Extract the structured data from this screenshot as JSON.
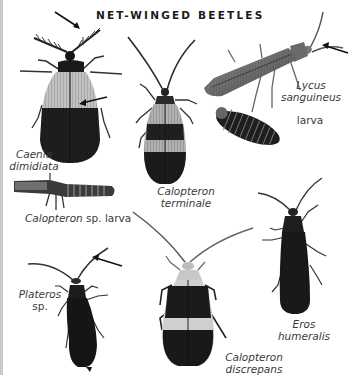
{
  "page": {
    "title": "NET-WINGED BEETLES",
    "background": "#ffffff",
    "edge_strip_color": "#c9c9c9"
  },
  "specimens": [
    {
      "id": "caenia-dimidiata",
      "label_line1": "Caenia",
      "label_line2": "dimidiata",
      "italic": true,
      "annotation": "arrow pointing to pectinate antenna and wing reticulation"
    },
    {
      "id": "calopteron-terminale",
      "label_line1": "Calopteron",
      "label_line2": "terminale",
      "italic": true
    },
    {
      "id": "lycus-sanguineus",
      "label_line1": "Lycus",
      "label_line2": "sanguineus",
      "italic": true,
      "annotation": "arrow pointing to antenna"
    },
    {
      "id": "lycus-larva",
      "label_line1": "larva",
      "italic": false
    },
    {
      "id": "calopteron-larva",
      "label_genus": "Calopteron",
      "label_rest": " sp. larva"
    },
    {
      "id": "plateros-sp",
      "label_line1": "Plateros",
      "label_line2": "sp.",
      "annotation": "arrow pointing to antenna"
    },
    {
      "id": "calopteron-discrepans",
      "label_line1": "Calopteron",
      "label_line2": "discrepans",
      "italic": true
    },
    {
      "id": "eros-humeralis",
      "label_line1": "Eros",
      "label_line2": "humeralis",
      "italic": true
    }
  ],
  "colors": {
    "dark_band": "#1c1c1c",
    "light_wing": "#bdbdbd",
    "lycus_body": "#6e6e6e",
    "label_text": "#3a3a3a",
    "title_text": "#1a1a1a"
  }
}
